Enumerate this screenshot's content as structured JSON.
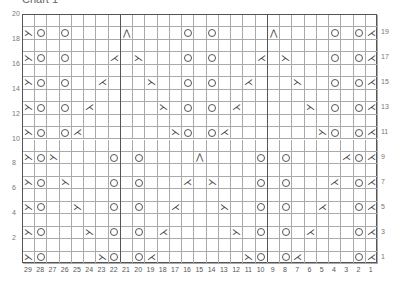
{
  "title": "Chart 1",
  "chart_data": {
    "type": "knitting-chart",
    "title": "Chart 1",
    "columns": 29,
    "rows": 20,
    "column_labels": [
      29,
      28,
      27,
      26,
      25,
      24,
      23,
      22,
      21,
      20,
      19,
      18,
      17,
      16,
      15,
      14,
      13,
      12,
      11,
      10,
      9,
      8,
      7,
      6,
      5,
      4,
      3,
      2,
      1
    ],
    "left_row_labels": [
      20,
      18,
      16,
      14,
      12,
      10,
      8,
      6,
      4,
      2
    ],
    "right_row_labels": [
      19,
      17,
      15,
      13,
      11,
      9,
      7,
      5,
      3,
      1
    ],
    "section_dividers_after_col": [
      22,
      10
    ],
    "legend": {
      "O": "yarn over",
      "ssk": "left-leaning decrease",
      "k2tog": "right-leaning decrease",
      "cdd": "centered double decrease"
    },
    "stitches": {
      "19": {
        "29": "ssk",
        "28": "O",
        "26": "O",
        "21": "cdd",
        "16": "O",
        "14": "O",
        "9": "cdd",
        "4": "O",
        "2": "O",
        "1": "k2tog"
      },
      "17": {
        "29": "ssk",
        "28": "O",
        "26": "O",
        "22": "k2tog",
        "20": "ssk",
        "16": "O",
        "14": "O",
        "10": "k2tog",
        "8": "ssk",
        "4": "O",
        "2": "O",
        "1": "k2tog"
      },
      "15": {
        "29": "ssk",
        "28": "O",
        "26": "O",
        "23": "k2tog",
        "19": "ssk",
        "16": "O",
        "14": "O",
        "11": "k2tog",
        "7": "ssk",
        "4": "O",
        "2": "O",
        "1": "k2tog"
      },
      "13": {
        "29": "ssk",
        "28": "O",
        "26": "O",
        "24": "k2tog",
        "18": "ssk",
        "16": "O",
        "14": "O",
        "12": "k2tog",
        "6": "ssk",
        "4": "O",
        "2": "O",
        "1": "k2tog"
      },
      "11": {
        "29": "ssk",
        "28": "O",
        "26": "O",
        "25": "k2tog",
        "17": "ssk",
        "16": "O",
        "14": "O",
        "13": "k2tog",
        "5": "ssk",
        "4": "O",
        "2": "O",
        "1": "k2tog"
      },
      "9": {
        "29": "ssk",
        "28": "O",
        "27": "ssk",
        "22": "O",
        "20": "O",
        "15": "cdd",
        "10": "O",
        "8": "O",
        "3": "k2tog",
        "2": "O",
        "1": "k2tog"
      },
      "7": {
        "29": "ssk",
        "28": "O",
        "26": "ssk",
        "22": "O",
        "20": "O",
        "16": "k2tog",
        "14": "ssk",
        "10": "O",
        "8": "O",
        "4": "k2tog",
        "2": "O",
        "1": "k2tog"
      },
      "5": {
        "29": "ssk",
        "28": "O",
        "25": "ssk",
        "22": "O",
        "20": "O",
        "17": "k2tog",
        "13": "ssk",
        "10": "O",
        "8": "O",
        "5": "k2tog",
        "2": "O",
        "1": "k2tog"
      },
      "3": {
        "29": "ssk",
        "28": "O",
        "24": "ssk",
        "22": "O",
        "20": "O",
        "18": "k2tog",
        "12": "ssk",
        "10": "O",
        "8": "O",
        "6": "k2tog",
        "2": "O",
        "1": "k2tog"
      },
      "1": {
        "29": "ssk",
        "28": "O",
        "23": "ssk",
        "22": "O",
        "20": "O",
        "19": "k2tog",
        "11": "ssk",
        "10": "O",
        "8": "O",
        "7": "k2tog",
        "2": "O",
        "1": "k2tog"
      }
    },
    "glyphs": {
      "ssk": "⋋",
      "k2tog": "⋌",
      "cdd": "⋀"
    }
  }
}
